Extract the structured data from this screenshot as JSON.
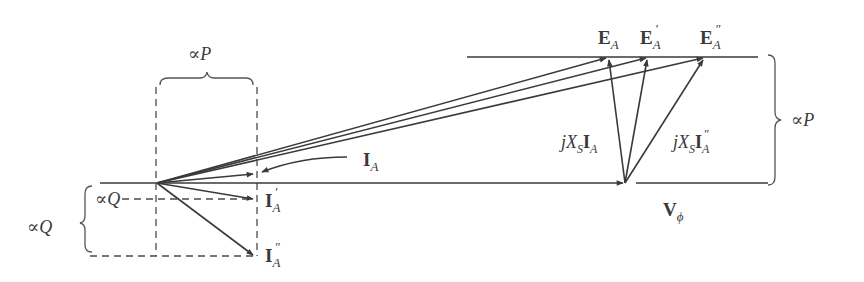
{
  "diagram": {
    "labels": {
      "top_brace": "∝P",
      "right_brace": "∝P",
      "left_brace": "∝Q",
      "inner_q": "∝Q",
      "ea": "E",
      "ea_sub": "A",
      "ea1": "E",
      "ea1_sub": "A",
      "ea1_prime": "′",
      "ea2": "E",
      "ea2_sub": "A",
      "ea2_prime": "″",
      "ia": "I",
      "ia_sub": "A",
      "ia1": "I",
      "ia1_sub": "A",
      "ia1_prime": "′",
      "ia2": "I",
      "ia2_sub": "A",
      "ia2_prime": "″",
      "vphi": "V",
      "vphi_sub": "ϕ",
      "jxs_ia_j": "jX",
      "jxs_ia_s": "S",
      "jxs_ia_i": "I",
      "jxs_ia_a": "A",
      "jxs_ia2_j": "jX",
      "jxs_ia2_s": "S",
      "jxs_ia2_i": "I",
      "jxs_ia2_a": "A",
      "jxs_ia2_prime": "″"
    },
    "phasors": {
      "origin": [
        157,
        183
      ],
      "V_phi": [
        625,
        183
      ],
      "E_A": [
        608,
        57
      ],
      "E_A_prime": [
        648,
        57
      ],
      "E_A_double_prime": [
        705,
        57
      ],
      "I_A": [
        255,
        174
      ],
      "I_A_prime": [
        255,
        199
      ],
      "I_A_double_prime": [
        255,
        256
      ]
    },
    "colors": {
      "stroke": "#3a3a3a",
      "background": "#ffffff"
    }
  }
}
